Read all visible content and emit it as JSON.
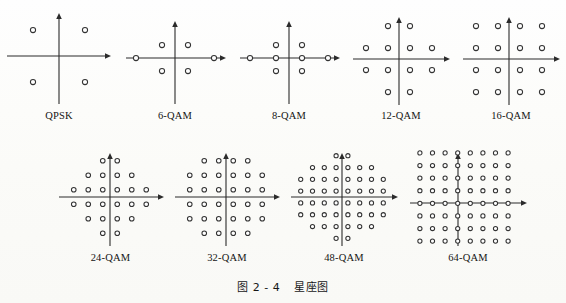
{
  "figure": {
    "caption_prefix": "图",
    "caption_number": "2 - 4",
    "caption_title": "星座图",
    "ink_color": "#2b2b2b",
    "marker_color": "#333333",
    "background_color": "#fdfdfb"
  },
  "chart_data": {
    "type": "scatter",
    "xlabel": "",
    "ylabel": "",
    "grid": false,
    "legend": "none",
    "panels": [
      {
        "label": "QPSK",
        "count": 4,
        "rows_per_line": [
          2,
          2
        ],
        "x": [
          -1,
          1,
          -1,
          1
        ],
        "y": [
          1,
          1,
          -1,
          -1
        ],
        "axis": {
          "x_arrow": "right",
          "y_arrow": "up"
        }
      },
      {
        "label": "6-QAM",
        "count": 6,
        "rows_per_line": [
          2,
          2,
          2
        ],
        "x": [
          -1,
          1,
          -3,
          3,
          -1,
          1
        ],
        "y": [
          1,
          1,
          0,
          0,
          -1,
          -1
        ],
        "axis": {
          "x_arrow": "right",
          "y_arrow": "up"
        }
      },
      {
        "label": "8-QAM",
        "count": 8,
        "rows_per_line": [
          2,
          4,
          2
        ],
        "x": [
          -1,
          1,
          -3,
          -1,
          1,
          3,
          -1,
          1
        ],
        "y": [
          1,
          1,
          0,
          0,
          0,
          0,
          -1,
          -1
        ],
        "axis": {
          "x_arrow": "right",
          "y_arrow": "up"
        }
      },
      {
        "label": "12-QAM",
        "count": 12,
        "rows_per_line": [
          2,
          4,
          4,
          2
        ],
        "x": [
          -1,
          1,
          -3,
          -1,
          1,
          3,
          -3,
          -1,
          1,
          3,
          -1,
          1
        ],
        "y": [
          3,
          3,
          1,
          1,
          1,
          1,
          -1,
          -1,
          -1,
          -1,
          -3,
          -3
        ],
        "axis": {
          "x_arrow": "right",
          "y_arrow": "up"
        }
      },
      {
        "label": "16-QAM",
        "count": 16,
        "rows_per_line": [
          4,
          4,
          4,
          4
        ],
        "x": [
          -3,
          -1,
          1,
          3,
          -3,
          -1,
          1,
          3,
          -3,
          -1,
          1,
          3,
          -3,
          -1,
          1,
          3
        ],
        "y": [
          3,
          3,
          3,
          3,
          1,
          1,
          1,
          1,
          -1,
          -1,
          -1,
          -1,
          -3,
          -3,
          -3,
          -3
        ],
        "axis": {
          "x_arrow": "right",
          "y_arrow": "up"
        }
      },
      {
        "label": "24-QAM",
        "count": 24,
        "rows_per_line": [
          2,
          4,
          6,
          6,
          4,
          2
        ],
        "axis": {
          "x_arrow": "right",
          "y_arrow": "up"
        }
      },
      {
        "label": "32-QAM",
        "count": 32,
        "rows_per_line": [
          4,
          6,
          6,
          6,
          6,
          4
        ],
        "axis": {
          "x_arrow": "right",
          "y_arrow": "up"
        }
      },
      {
        "label": "48-QAM",
        "count": 48,
        "rows_per_line": [
          2,
          6,
          8,
          8,
          8,
          8,
          6,
          2
        ],
        "axis": {
          "x_arrow": "right",
          "y_arrow": "up"
        }
      },
      {
        "label": "64-QAM",
        "count": 64,
        "rows_per_line": [
          8,
          8,
          8,
          8,
          8,
          8,
          8,
          8
        ],
        "axis": {
          "x_arrow": "right",
          "y_arrow": "up"
        }
      }
    ]
  },
  "panels": {
    "qpsk": {
      "label": "QPSK"
    },
    "qam6": {
      "label": "6-QAM"
    },
    "qam8": {
      "label": "8-QAM"
    },
    "qam12": {
      "label": "12-QAM"
    },
    "qam16": {
      "label": "16-QAM"
    },
    "qam24": {
      "label": "24-QAM"
    },
    "qam32": {
      "label": "32-QAM"
    },
    "qam48": {
      "label": "48-QAM"
    },
    "qam64": {
      "label": "64-QAM"
    }
  }
}
